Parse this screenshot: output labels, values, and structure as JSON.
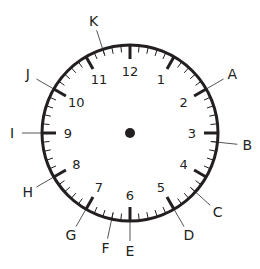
{
  "diagram": {
    "type": "clock-face",
    "center": {
      "x": 130,
      "y": 133
    },
    "radius": 88,
    "colors": {
      "stroke": "#231f20",
      "pointer": "#555555",
      "background": "#ffffff"
    },
    "hour_numbers": [
      "12",
      "1",
      "2",
      "3",
      "4",
      "5",
      "6",
      "7",
      "8",
      "9",
      "10",
      "11"
    ],
    "minute_ticks": 60,
    "center_dot": true,
    "labels": [
      {
        "letter": "A",
        "minute": 10
      },
      {
        "letter": "B",
        "minute": 16
      },
      {
        "letter": "C",
        "minute": 22
      },
      {
        "letter": "D",
        "minute": 25
      },
      {
        "letter": "E",
        "minute": 30
      },
      {
        "letter": "F",
        "minute": 32
      },
      {
        "letter": "G",
        "minute": 35
      },
      {
        "letter": "H",
        "minute": 40
      },
      {
        "letter": "I",
        "minute": 45
      },
      {
        "letter": "J",
        "minute": 50
      },
      {
        "letter": "K",
        "minute": 57
      }
    ]
  }
}
